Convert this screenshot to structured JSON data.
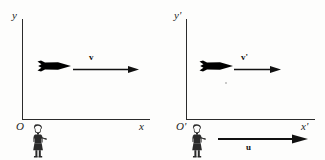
{
  "figure": {
    "panels": [
      {
        "id": "frame-s",
        "axes": {
          "y_label": "y",
          "x_label": "x",
          "origin_label": "O"
        },
        "objects": [
          {
            "type": "rocket",
            "name": "rocket",
            "direction": "right"
          },
          {
            "type": "vector",
            "name": "velocity-vector",
            "label": "v",
            "label_position": "above",
            "direction": "right"
          },
          {
            "type": "observer",
            "name": "observer-person",
            "pose": "standing"
          }
        ]
      },
      {
        "id": "frame-s-prime",
        "axes": {
          "y_label": "y'",
          "x_label": "x'",
          "origin_label": "O'"
        },
        "objects": [
          {
            "type": "rocket",
            "name": "rocket",
            "direction": "right"
          },
          {
            "type": "vector",
            "name": "relative-velocity-vector",
            "label": "v'",
            "label_position": "above",
            "direction": "right"
          },
          {
            "type": "observer",
            "name": "observer-person",
            "pose": "standing"
          },
          {
            "type": "vector",
            "name": "frame-velocity-vector",
            "label": "u",
            "label_position": "below",
            "direction": "right"
          }
        ]
      }
    ]
  },
  "colors": {
    "ink": "#1c1c1c",
    "axis": "#2b2b2b",
    "rocket": "#000000",
    "background": "#fdfdfc"
  }
}
